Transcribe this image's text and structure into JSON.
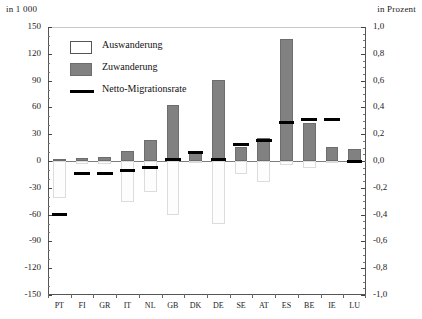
{
  "header": {
    "left_axis_unit": "in 1 000",
    "right_axis_unit": "in Prozent"
  },
  "legend": {
    "position": "inside-top-left",
    "items": [
      {
        "label": "Auswanderung",
        "swatch": "white-rect-outline",
        "color": "#ffffff"
      },
      {
        "label": "Zuwanderung",
        "swatch": "gray-rect-filled",
        "color": "#818181"
      },
      {
        "label": "Netto-Migrationsrate",
        "swatch": "black-line",
        "color": "#000000"
      }
    ]
  },
  "chart_data": {
    "type": "bar",
    "title": "",
    "xlabel": "",
    "ylabel": "in 1 000",
    "y2label": "in Prozent",
    "ylim": [
      -150,
      150
    ],
    "y2lim": [
      -1.0,
      1.0
    ],
    "grid": false,
    "categories": [
      "PT",
      "FI",
      "GR",
      "IT",
      "NL",
      "GB",
      "DK",
      "DE",
      "SE",
      "AT",
      "ES",
      "BE",
      "IE",
      "LU"
    ],
    "ytick_labels": [
      "150",
      "120",
      "90",
      "60",
      "30",
      "0",
      "-30",
      "-60",
      "-90",
      "-120",
      "-150"
    ],
    "ytick_values": [
      150,
      120,
      90,
      60,
      30,
      0,
      -30,
      -60,
      -90,
      -120,
      -150
    ],
    "y2tick_labels": [
      "1,0",
      "0,8",
      "0,6",
      "0,4",
      "0,2",
      "0,0",
      "-0,2",
      "-0,4",
      "-0,6",
      "-0,8",
      "-1,0"
    ],
    "y2tick_values": [
      1.0,
      0.8,
      0.6,
      0.4,
      0.2,
      0.0,
      -0.2,
      -0.4,
      -0.6,
      -0.8,
      -1.0
    ],
    "series": [
      {
        "name": "Zuwanderung",
        "axis": "left",
        "unit": "in 1 000",
        "color": "#818181",
        "values": [
          2,
          3,
          5,
          11,
          24,
          63,
          11,
          91,
          16,
          26,
          137,
          42,
          16,
          13
        ]
      },
      {
        "name": "Auswanderung",
        "axis": "left",
        "unit": "in 1 000",
        "color": "#ffffff",
        "values": [
          -41,
          -3,
          -3,
          -46,
          -35,
          -61,
          -2,
          -70,
          -14,
          -23,
          -4,
          -8,
          -2,
          -2
        ]
      },
      {
        "name": "Netto-Migrationsrate",
        "axis": "right",
        "unit": "in Prozent",
        "color": "#000000",
        "values": [
          -0.4,
          -0.09,
          -0.09,
          -0.07,
          -0.05,
          0.01,
          0.06,
          0.01,
          0.12,
          0.15,
          0.29,
          0.31,
          0.31,
          0.0
        ]
      }
    ]
  }
}
